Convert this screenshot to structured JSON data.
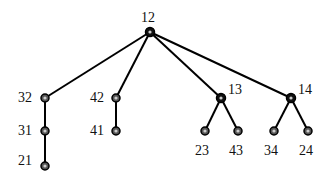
{
  "diagram": {
    "type": "tree",
    "root": "12",
    "nodes": [
      {
        "id": "12",
        "label": "12",
        "x": 150,
        "y": 32,
        "lx": 141,
        "ly": 22,
        "filled": true
      },
      {
        "id": "32",
        "label": "32",
        "x": 45,
        "y": 98,
        "lx": 18,
        "ly": 102,
        "filled": false
      },
      {
        "id": "31",
        "label": "31",
        "x": 45,
        "y": 131,
        "lx": 18,
        "ly": 135,
        "filled": false
      },
      {
        "id": "21",
        "label": "21",
        "x": 45,
        "y": 166,
        "lx": 18,
        "ly": 165,
        "filled": false
      },
      {
        "id": "42",
        "label": "42",
        "x": 116,
        "y": 98,
        "lx": 90,
        "ly": 102,
        "filled": false
      },
      {
        "id": "41",
        "label": "41",
        "x": 116,
        "y": 131,
        "lx": 90,
        "ly": 135,
        "filled": false
      },
      {
        "id": "13",
        "label": "13",
        "x": 221,
        "y": 98,
        "lx": 228,
        "ly": 94,
        "filled": true
      },
      {
        "id": "23",
        "label": "23",
        "x": 205,
        "y": 131,
        "lx": 195,
        "ly": 155,
        "filled": false
      },
      {
        "id": "43",
        "label": "43",
        "x": 238,
        "y": 131,
        "lx": 229,
        "ly": 155,
        "filled": false
      },
      {
        "id": "14",
        "label": "14",
        "x": 291,
        "y": 98,
        "lx": 298,
        "ly": 94,
        "filled": true
      },
      {
        "id": "34",
        "label": "34",
        "x": 274,
        "y": 131,
        "lx": 264,
        "ly": 155,
        "filled": false
      },
      {
        "id": "24",
        "label": "24",
        "x": 308,
        "y": 131,
        "lx": 299,
        "ly": 155,
        "filled": false
      }
    ],
    "edges": [
      [
        "12",
        "32"
      ],
      [
        "12",
        "42"
      ],
      [
        "12",
        "13"
      ],
      [
        "12",
        "14"
      ],
      [
        "32",
        "31"
      ],
      [
        "31",
        "21"
      ],
      [
        "42",
        "41"
      ],
      [
        "13",
        "23"
      ],
      [
        "13",
        "43"
      ],
      [
        "14",
        "34"
      ],
      [
        "14",
        "24"
      ]
    ]
  }
}
